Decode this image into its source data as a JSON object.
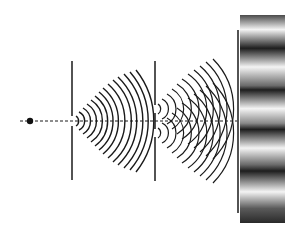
{
  "diagram": {
    "title": "Double-slit interference",
    "colors": {
      "background": "#ffffff",
      "ink": "#1a1a1a",
      "fringe_dark": "#1e1e1e",
      "fringe_light": "#f2f2f2"
    },
    "source": {
      "x": 30,
      "y": 121
    },
    "axis": {
      "y": 121,
      "x1": 20,
      "x2": 237
    },
    "barrier1": {
      "x": 72,
      "y1": 61,
      "y2": 180,
      "slit_y": 121,
      "slit_gap": 5
    },
    "barrier2": {
      "x": 155,
      "y1": 61,
      "y2": 181,
      "slits_y": [
        109,
        133
      ],
      "slit_gap": 5
    },
    "screen": {
      "x": 238,
      "y1": 30,
      "y2": 213
    },
    "fringe_panel": {
      "x": 240,
      "y": 15,
      "width": 45,
      "height": 208,
      "dark_bands": 5
    },
    "labels": []
  }
}
